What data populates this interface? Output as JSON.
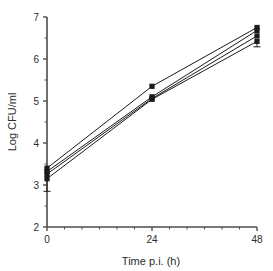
{
  "chart_data": {
    "type": "line",
    "title": "",
    "subtitle": "",
    "xlabel": "Time p.i. (h)",
    "ylabel": "Log CFU/ml",
    "x": [
      0,
      24,
      48
    ],
    "xlim": [
      0,
      48
    ],
    "ylim": [
      2,
      7
    ],
    "x_ticks": [
      0,
      24,
      48
    ],
    "x_tick_labels": [
      "0",
      "24",
      "48"
    ],
    "x_minor_ticks_per_interval": 6,
    "y_ticks": [
      2,
      3,
      4,
      5,
      6,
      7
    ],
    "y_tick_labels": [
      "2",
      "3",
      "4",
      "5",
      "6",
      "7"
    ],
    "y_minor_ticks_per_interval": 2,
    "grid": false,
    "legend": false,
    "legend_position": "none",
    "marker": "filled-square",
    "line_color": "#1a1a1a",
    "marker_color": "#1a1a1a",
    "series": [
      {
        "name": "Series 1",
        "values": [
          3.4,
          5.35,
          6.75
        ],
        "err_low": [
          0.0,
          0.0,
          0.0
        ],
        "err_high": [
          0.0,
          0.0,
          0.0
        ]
      },
      {
        "name": "Series 2",
        "values": [
          3.32,
          5.1,
          6.68
        ],
        "err_low": [
          0.0,
          0.0,
          0.0
        ],
        "err_high": [
          0.0,
          0.0,
          0.0
        ]
      },
      {
        "name": "Series 3",
        "values": [
          3.26,
          5.06,
          6.55
        ],
        "err_low": [
          0.0,
          0.0,
          0.0
        ],
        "err_high": [
          0.0,
          0.0,
          0.0
        ]
      },
      {
        "name": "Series 4",
        "values": [
          3.15,
          5.04,
          6.42
        ],
        "err_low": [
          0.3,
          0.0,
          0.13
        ],
        "err_high": [
          0.0,
          0.0,
          0.0
        ]
      }
    ],
    "annotations": []
  },
  "axes": {
    "x_axis_title": "Time p.i. (h)",
    "y_axis_title": "Log CFU/ml"
  },
  "colors": {
    "axis": "#4d4d4d",
    "ink": "#1a1a1a",
    "background": "#ffffff"
  }
}
